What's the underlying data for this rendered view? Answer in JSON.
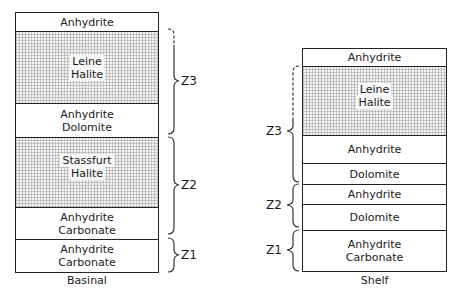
{
  "columns": {
    "basinal": {
      "caption": "Basinal",
      "layers": [
        {
          "lines": [
            "Anhydrite"
          ],
          "stippled": false
        },
        {
          "lines": [
            "Leine",
            "Halite"
          ],
          "stippled": true
        },
        {
          "lines": [
            "Anhydrite",
            "Dolomite"
          ],
          "stippled": false
        },
        {
          "lines": [
            "Stassfurt",
            "Halite"
          ],
          "stippled": true
        },
        {
          "lines": [
            "Anhydrite",
            "Carbonate"
          ],
          "stippled": false
        },
        {
          "lines": [
            "Anhydrite",
            "Carbonate"
          ],
          "stippled": false
        }
      ],
      "zones": [
        "Z3",
        "Z2",
        "Z1"
      ]
    },
    "shelf": {
      "caption": "Shelf",
      "layers": [
        {
          "lines": [
            "Anhydrite"
          ],
          "stippled": false
        },
        {
          "lines": [
            "Leine",
            "Halite"
          ],
          "stippled": true
        },
        {
          "lines": [
            "Anhydrite"
          ],
          "stippled": false
        },
        {
          "lines": [
            "Dolomite"
          ],
          "stippled": false
        },
        {
          "lines": [
            "Anhydrite"
          ],
          "stippled": false
        },
        {
          "lines": [
            "Dolomite"
          ],
          "stippled": false
        },
        {
          "lines": [
            "Anhydrite",
            "Carbonate"
          ],
          "stippled": false
        }
      ],
      "zones": [
        "Z3",
        "Z2",
        "Z1"
      ]
    }
  }
}
